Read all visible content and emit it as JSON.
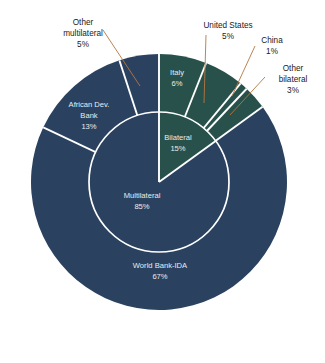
{
  "chart_data": {
    "type": "pie",
    "title": "",
    "subtitle": "",
    "xlabel": "",
    "ylabel": "",
    "legend_position": "none",
    "grid": false,
    "layout": "nested-donut",
    "units": "percent",
    "center": {
      "x": 159,
      "y": 182
    },
    "inner_radius": 70,
    "outer_radius": 128,
    "start_angle_deg": 0,
    "direction": "clockwise",
    "colors": {
      "bilateral": "#27514a",
      "multilateral": "#2a4260",
      "separator": "#ffffff",
      "leader": "#b5763f",
      "label_light": "#e8ecef",
      "label_dark": "#1a1a1a",
      "background": "#ffffff"
    },
    "rings": [
      {
        "name": "inner",
        "slices": [
          {
            "label": "Bilateral",
            "value": 15,
            "value_text": "15%",
            "color": "#27514a",
            "group": "bilateral"
          },
          {
            "label": "Multilateral",
            "value": 85,
            "value_text": "85%",
            "color": "#2a4260",
            "group": "multilateral"
          }
        ]
      },
      {
        "name": "outer",
        "slices": [
          {
            "label": "Italy",
            "value": 6,
            "value_text": "6%",
            "color": "#27514a",
            "group": "bilateral",
            "label_style": "inside"
          },
          {
            "label": "United States",
            "value": 5,
            "value_text": "5%",
            "color": "#27514a",
            "group": "bilateral",
            "label_style": "callout"
          },
          {
            "label": "China",
            "value": 1,
            "value_text": "1%",
            "color": "#27514a",
            "group": "bilateral",
            "label_style": "callout"
          },
          {
            "label": "Other bilateral",
            "value": 3,
            "value_text": "3%",
            "color": "#27514a",
            "group": "bilateral",
            "label_style": "callout"
          },
          {
            "label": "World Bank-IDA",
            "value": 67,
            "value_text": "67%",
            "color": "#2a4260",
            "group": "multilateral",
            "label_style": "inside"
          },
          {
            "label": "African Dev. Bank",
            "value": 13,
            "value_text": "13%",
            "color": "#2a4260",
            "group": "multilateral",
            "label_style": "inside"
          },
          {
            "label": "Other multilateral",
            "value": 5,
            "value_text": "5%",
            "color": "#2a4260",
            "group": "multilateral",
            "label_style": "callout"
          }
        ]
      }
    ]
  },
  "labels": {
    "inner": {
      "bilateral": {
        "name": "Bilateral",
        "pct": "15%"
      },
      "multilateral": {
        "name": "Multilateral",
        "pct": "85%"
      }
    },
    "inside": {
      "italy": {
        "name": "Italy",
        "pct": "6%"
      },
      "world_bank": {
        "name": "World Bank-IDA",
        "pct": "67%"
      },
      "afdb_line1": "African Dev.",
      "afdb_line2": "Bank",
      "afdb_pct": "13%"
    },
    "callouts": {
      "other_multilateral_line1": "Other",
      "other_multilateral_line2": "multilateral",
      "other_multilateral_pct": "5%",
      "united_states_line1": "United States",
      "united_states_pct": "5%",
      "china_line1": "China",
      "china_pct": "1%",
      "other_bilateral_line1": "Other",
      "other_bilateral_line2": "bilateral",
      "other_bilateral_pct": "3%"
    }
  }
}
